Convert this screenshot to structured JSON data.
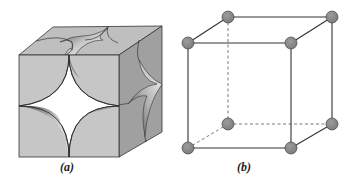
{
  "figure": {
    "panels": [
      {
        "id": "a",
        "label": "(a)",
        "description": "Space-filling model of simple cubic unit cell with corner sphere sections"
      },
      {
        "id": "b",
        "label": "(b)",
        "description": "Ball-and-stick model of simple cubic unit cell with 8 corner atoms"
      }
    ],
    "colors": {
      "face_front": "#c4c4c4",
      "face_top": "#bdbdbd",
      "face_side": "#9e9e9e",
      "edge": "#333333",
      "atom": "#8a8a8a",
      "atom_stroke": "#444444"
    }
  }
}
